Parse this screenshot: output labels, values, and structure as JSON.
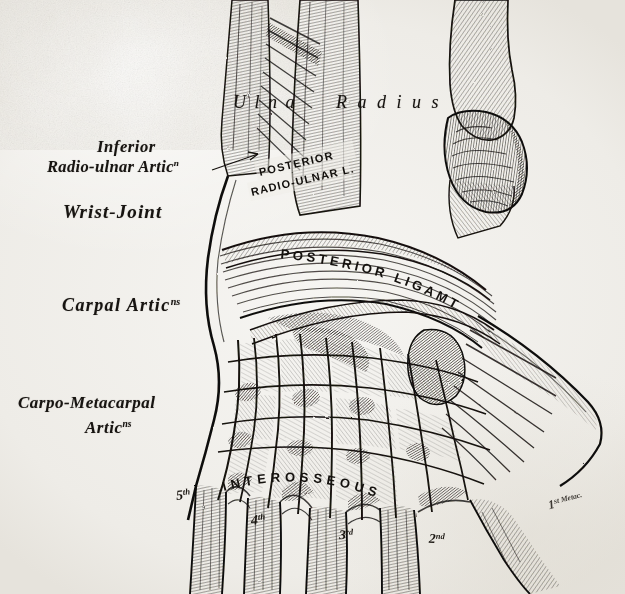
{
  "plate": {
    "kind": "anatomical-engraving",
    "subject": "Posterior view of the wrist and carpal articulations",
    "paper_color": "#f1efea",
    "ink_color": "#17130f"
  },
  "labels": {
    "inferior": "Inferior",
    "radio_ulnar_artic": "Radio-ulnar Artic",
    "radio_ulnar_artic_sup": "n",
    "wrist_joint": "Wrist-Joint",
    "carpal_artic": "Carpal Artic",
    "carpal_artic_sup": "ns",
    "carpo_metacarpal": "Carpo-Metacarpal",
    "carpo_metacarpal_artic": "Artic",
    "carpo_metacarpal_sup": "ns"
  },
  "bones": {
    "ulna": "U l n a",
    "radius": "R a d i u s"
  },
  "ligaments": {
    "posterior": "POSTERIOR",
    "radio_ulnar_l": "RADIO-ULNAR L.",
    "posterior_ligament": "POSTERIOR LIGAMT",
    "interosseous": "INTEROSSEOUS"
  },
  "metacarpals": [
    {
      "num": "5",
      "sup": "th"
    },
    {
      "num": "4",
      "sup": "th"
    },
    {
      "num": "3",
      "sup": "rd"
    },
    {
      "num": "2",
      "sup": "nd"
    },
    {
      "num": "1",
      "sup": "st Metac."
    }
  ]
}
